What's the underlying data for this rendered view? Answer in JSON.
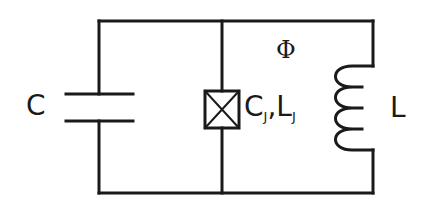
{
  "diagram": {
    "type": "circuit",
    "stroke_color": "#1a1a1a",
    "labels": {
      "capacitor": "C",
      "flux": "Φ",
      "junction_c": "C",
      "junction_c_sub": "J",
      "junction_sep": ",",
      "junction_l": "L",
      "junction_l_sub": "J",
      "inductor": "L"
    },
    "components": [
      {
        "id": "capacitor",
        "label": "C",
        "symbol": "capacitor"
      },
      {
        "id": "josephson-junction",
        "label": "CJ,LJ",
        "symbol": "crossed-box"
      },
      {
        "id": "inductor",
        "label": "L",
        "symbol": "coil"
      }
    ],
    "annotations": [
      {
        "label": "Φ",
        "meaning": "flux"
      }
    ]
  }
}
